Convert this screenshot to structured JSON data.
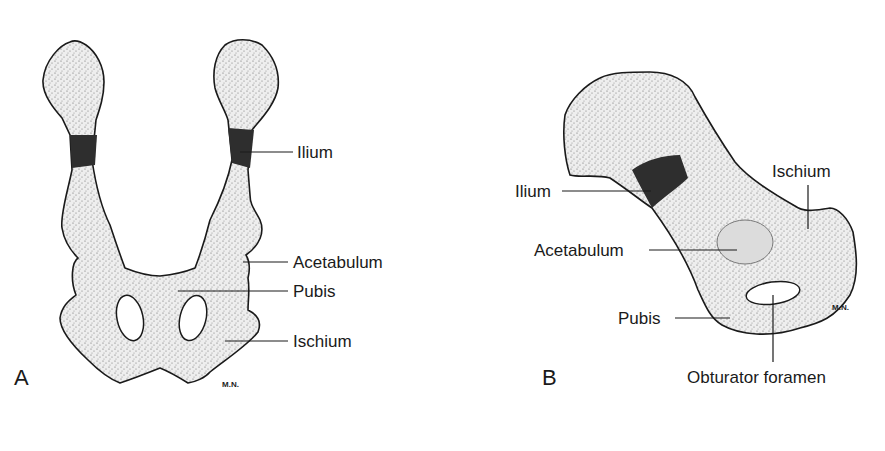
{
  "figure": {
    "panels": [
      {
        "id": "A",
        "panel_label": "A",
        "view": "ventral/dorsal view of pelvis",
        "labels": {
          "ilium": "Ilium",
          "acetabulum": "Acetabulum",
          "pubis": "Pubis",
          "ischium": "Ischium"
        },
        "signature": "M.N."
      },
      {
        "id": "B",
        "panel_label": "B",
        "view": "lateral view of hip bone",
        "labels": {
          "ilium": "Ilium",
          "ischium": "Ischium",
          "acetabulum": "Acetabulum",
          "pubis": "Pubis",
          "obturator_foramen": "Obturator foramen"
        },
        "signature": "M.N."
      }
    ],
    "colors": {
      "outline": "#1a1a1a",
      "bone_fill": "#e9e9e9",
      "stipple": "#555555",
      "growth_plate": "#2a2a2a"
    }
  }
}
